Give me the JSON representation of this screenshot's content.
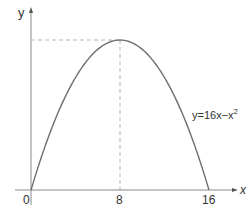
{
  "chart_data": {
    "type": "line",
    "title": "",
    "function_label": "y=16x−x",
    "function_exponent": "2",
    "equation": "y = 16x - x^2",
    "xlabel": "x",
    "ylabel": "y",
    "x_ticks": [
      "0",
      "8",
      "16"
    ],
    "x_tick_values": [
      0,
      8,
      16
    ],
    "xlim": [
      0,
      16
    ],
    "ylim": [
      0,
      64
    ],
    "grid": false,
    "legend": "none",
    "series": [
      {
        "name": "y=16x-x^2",
        "x": [
          0,
          2,
          4,
          6,
          8,
          10,
          12,
          14,
          16
        ],
        "y": [
          0,
          28,
          48,
          60,
          64,
          60,
          48,
          28,
          0
        ]
      }
    ],
    "annotations": [
      {
        "type": "dashed-horizontal",
        "from_x": 0,
        "to_x": 8,
        "y": 64
      },
      {
        "type": "dashed-vertical",
        "x": 8,
        "from_y": 0,
        "to_y": 64
      }
    ],
    "colors": {
      "curve": "#6e6e6e",
      "axes": "#8a8a8a",
      "guides": "#b5b5b5",
      "text": "#333333"
    }
  }
}
